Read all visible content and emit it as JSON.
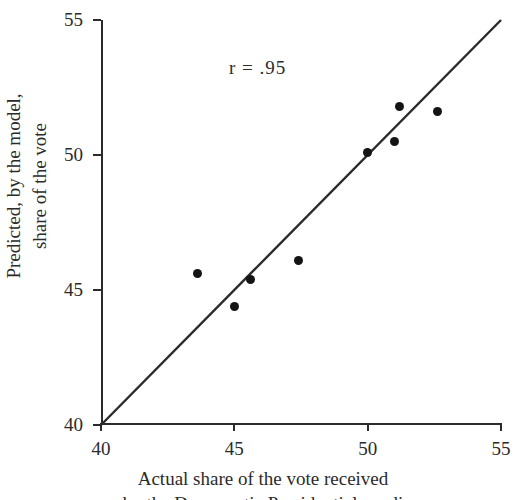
{
  "figure": {
    "annotation": "r  =  .95",
    "y_axis_title_line1": "Predicted, by the model,",
    "y_axis_title_line2": "share of the vote",
    "x_axis_title_line1": "Actual share of the vote received",
    "x_axis_title_line2": "by the Democratic Presidential candi"
  },
  "chart_data": {
    "type": "scatter",
    "title": "",
    "xlabel": "Actual share of the vote received",
    "ylabel": "Predicted, by the model, share of the vote",
    "xlim": [
      40,
      55
    ],
    "ylim": [
      40,
      55
    ],
    "xticks": [
      40,
      45,
      50,
      55
    ],
    "yticks": [
      40,
      45,
      50,
      55
    ],
    "xtick_labels": [
      "40",
      "45",
      "50",
      "55"
    ],
    "ytick_labels": [
      "40",
      "45",
      "50",
      "55"
    ],
    "grid": false,
    "legend": "none",
    "annotations": [
      {
        "text": "r  =  .95",
        "x": 44.8,
        "y": 53.2
      }
    ],
    "reference_line": {
      "name": "identity-line",
      "from": [
        40,
        40
      ],
      "to": [
        55,
        55
      ],
      "slope": 1,
      "intercept": 0
    },
    "marker_color": "#141414",
    "line_color": "#2b2b2b",
    "points": [
      {
        "x": 43.6,
        "y": 45.6
      },
      {
        "x": 45.0,
        "y": 44.4
      },
      {
        "x": 45.6,
        "y": 45.4
      },
      {
        "x": 47.4,
        "y": 46.1
      },
      {
        "x": 50.0,
        "y": 50.1
      },
      {
        "x": 51.0,
        "y": 50.5
      },
      {
        "x": 51.2,
        "y": 51.8
      },
      {
        "x": 52.6,
        "y": 51.6
      }
    ]
  }
}
